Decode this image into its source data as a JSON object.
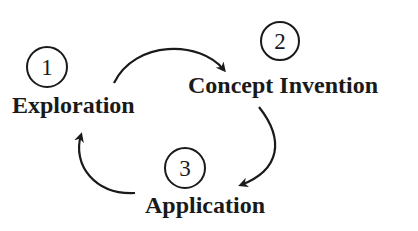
{
  "diagram": {
    "type": "cycle",
    "steps": [
      {
        "number": "1",
        "label": "Exploration"
      },
      {
        "number": "2",
        "label": "Concept Invention"
      },
      {
        "number": "3",
        "label": "Application"
      }
    ],
    "edges": [
      {
        "from": "Exploration",
        "to": "Concept Invention"
      },
      {
        "from": "Concept Invention",
        "to": "Application"
      },
      {
        "from": "Application",
        "to": "Exploration"
      }
    ],
    "colors": {
      "stroke": "#1a1a1a",
      "background": "#ffffff"
    }
  }
}
